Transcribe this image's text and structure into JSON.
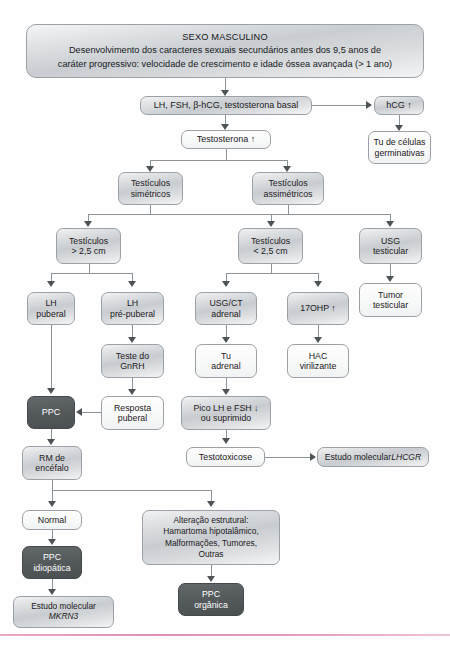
{
  "diagram": {
    "type": "flowchart",
    "colors": {
      "node_border": "#9ba1a6",
      "node_fill_light": "#e2e4e6",
      "node_fill_plain": "#f7f8f8",
      "node_fill_dark": "#54595c",
      "dark_node_text": "#ffffff",
      "connector": "#8d9499",
      "arrow": "#4e5356",
      "bottom_rule": "#dd8fb6",
      "text": "#1d2023"
    }
  },
  "banner": {
    "title": "SEXO MASCULINO",
    "line2": "Desenvolvimento dos caracteres sexuais secundários antes dos 9,5 anos de",
    "line3": "caráter progressivo:  velocidade de crescimento  e  idade óssea avançada (> 1 ano)"
  },
  "nodes": {
    "labs": "LH, FSH, β-hCG, testosterona basal",
    "hcg_up": "hCG ↑",
    "germ_tumor_l1": "Tu de células",
    "germ_tumor_l2": "germinativas",
    "testosterona_up": "Testosterona ↑",
    "testis_sym_l1": "Testículos",
    "testis_sym_l2": "simétricos",
    "testis_asym_l1": "Testículos",
    "testis_asym_l2": "assimétricos",
    "testis_gt_l1": "Testículos",
    "testis_gt_l2": "> 2,5 cm",
    "testis_lt_l1": "Testículos",
    "testis_lt_l2": "< 2,5 cm",
    "usg_testicular_l1": "USG",
    "usg_testicular_l2": "testicular",
    "tumor_testicular_l1": "Tumor",
    "tumor_testicular_l2": "testicular",
    "lh_puberal_l1": "LH",
    "lh_puberal_l2": "puberal",
    "lh_prepuberal_l1": "LH",
    "lh_prepuberal_l2": "pré-puberal",
    "usg_ct_adrenal_l1": "USG/CT",
    "usg_ct_adrenal_l2": "adrenal",
    "ohp_up": "17OHP ↑",
    "teste_gnrh_l1": "Teste do",
    "teste_gnrh_l2": "GnRH",
    "tu_adrenal_l1": "Tu",
    "tu_adrenal_l2": "adrenal",
    "hac_l1": "HAC",
    "hac_l2": "virilizante",
    "ppc": "PPC",
    "resposta_puberal_l1": "Resposta",
    "resposta_puberal_l2": "puberal",
    "pico_l1": "Pico LH e FSH ↓",
    "pico_l2": "ou suprimido",
    "rm_encefalo_l1": "RM de",
    "rm_encefalo_l2": "encéfalo",
    "testotoxicose": "Testotoxicose",
    "estudo_lhcgr_pre": "Estudo molecular ",
    "estudo_lhcgr_gene": "LHCGR",
    "normal": "Normal",
    "alteracao_l1": "Alteração estrutural:",
    "alteracao_l2": "Hamartoma hipotalâmico,",
    "alteracao_l3": "Malformações, Tumores,",
    "alteracao_l4": "Outras",
    "ppc_idiopatica_l1": "PPC",
    "ppc_idiopatica_l2": "idiopática",
    "ppc_organica_l1": "PPC",
    "ppc_organica_l2": "orgânica",
    "estudo_mkrn3_pre": "Estudo molecular",
    "estudo_mkrn3_gene": "MKRN3"
  }
}
